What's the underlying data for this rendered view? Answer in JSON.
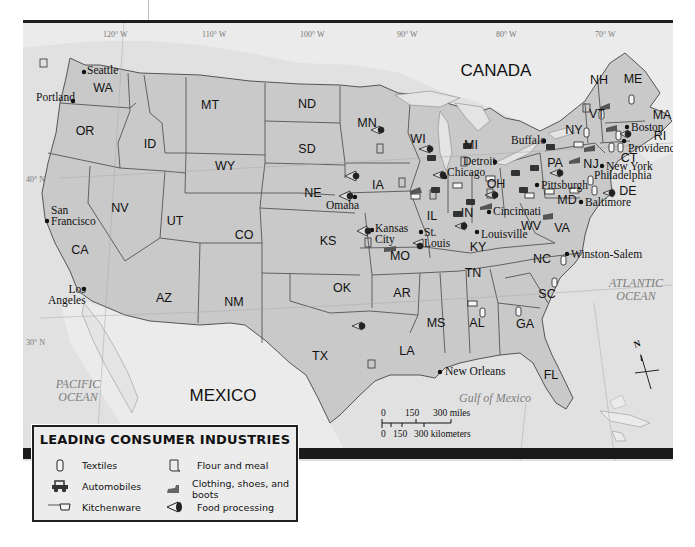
{
  "map": {
    "countries": [
      {
        "name": "CANADA",
        "x": 496,
        "y": 68
      },
      {
        "name": "MEXICO",
        "x": 223,
        "y": 393
      }
    ],
    "water_bodies": [
      {
        "name": "PACIFIC\nOCEAN",
        "line1": "PACIFIC",
        "line2": "OCEAN",
        "x": 78,
        "y": 388
      },
      {
        "name": "ATLANTIC\nOCEAN",
        "line1": "ATLANTIC",
        "line2": "OCEAN",
        "x": 636,
        "y": 287
      },
      {
        "name": "Gulf of Mexico",
        "line1": "Gulf of Mexico",
        "line2": "",
        "x": 495,
        "y": 395
      }
    ],
    "longitude_labels": [
      "120° W",
      "110° W",
      "100° W",
      "90° W",
      "80° W",
      "70° W"
    ],
    "latitude_labels": [
      "40° N",
      "30° N"
    ],
    "states": [
      {
        "abbr": "WA",
        "x": 103,
        "y": 85
      },
      {
        "abbr": "OR",
        "x": 85,
        "y": 128
      },
      {
        "abbr": "ID",
        "x": 150,
        "y": 141
      },
      {
        "abbr": "MT",
        "x": 210,
        "y": 102
      },
      {
        "abbr": "WY",
        "x": 225,
        "y": 163
      },
      {
        "abbr": "ND",
        "x": 307,
        "y": 101
      },
      {
        "abbr": "SD",
        "x": 307,
        "y": 146
      },
      {
        "abbr": "MN",
        "x": 367,
        "y": 120
      },
      {
        "abbr": "WI",
        "x": 418,
        "y": 136
      },
      {
        "abbr": "MI",
        "x": 471,
        "y": 142
      },
      {
        "abbr": "NV",
        "x": 120,
        "y": 205
      },
      {
        "abbr": "UT",
        "x": 175,
        "y": 218
      },
      {
        "abbr": "CO",
        "x": 244,
        "y": 232
      },
      {
        "abbr": "NE",
        "x": 313,
        "y": 190
      },
      {
        "abbr": "IA",
        "x": 378,
        "y": 182
      },
      {
        "abbr": "IL",
        "x": 432,
        "y": 213
      },
      {
        "abbr": "IN",
        "x": 467,
        "y": 210
      },
      {
        "abbr": "OH",
        "x": 496,
        "y": 181
      },
      {
        "abbr": "PA",
        "x": 555,
        "y": 160
      },
      {
        "abbr": "NY",
        "x": 574,
        "y": 127
      },
      {
        "abbr": "VT",
        "x": 597,
        "y": 111
      },
      {
        "abbr": "NH",
        "x": 599,
        "y": 77
      },
      {
        "abbr": "ME",
        "x": 633,
        "y": 76
      },
      {
        "abbr": "MA",
        "x": 662,
        "y": 112
      },
      {
        "abbr": "RI",
        "x": 660,
        "y": 133
      },
      {
        "abbr": "CT",
        "x": 629,
        "y": 155
      },
      {
        "abbr": "NJ",
        "x": 591,
        "y": 161
      },
      {
        "abbr": "DE",
        "x": 628,
        "y": 188
      },
      {
        "abbr": "MD",
        "x": 567,
        "y": 197
      },
      {
        "abbr": "CA",
        "x": 80,
        "y": 247
      },
      {
        "abbr": "KS",
        "x": 328,
        "y": 238
      },
      {
        "abbr": "MO",
        "x": 400,
        "y": 253
      },
      {
        "abbr": "KY",
        "x": 478,
        "y": 244
      },
      {
        "abbr": "WV",
        "x": 531,
        "y": 223
      },
      {
        "abbr": "VA",
        "x": 562,
        "y": 225
      },
      {
        "abbr": "AZ",
        "x": 164,
        "y": 295
      },
      {
        "abbr": "NM",
        "x": 234,
        "y": 299
      },
      {
        "abbr": "OK",
        "x": 342,
        "y": 285
      },
      {
        "abbr": "AR",
        "x": 402,
        "y": 290
      },
      {
        "abbr": "TN",
        "x": 473,
        "y": 270
      },
      {
        "abbr": "NC",
        "x": 542,
        "y": 256
      },
      {
        "abbr": "SC",
        "x": 547,
        "y": 291
      },
      {
        "abbr": "MS",
        "x": 436,
        "y": 320
      },
      {
        "abbr": "AL",
        "x": 477,
        "y": 320
      },
      {
        "abbr": "GA",
        "x": 525,
        "y": 321
      },
      {
        "abbr": "LA",
        "x": 407,
        "y": 348
      },
      {
        "abbr": "TX",
        "x": 320,
        "y": 353
      },
      {
        "abbr": "FL",
        "x": 551,
        "y": 372
      }
    ],
    "cities": [
      {
        "name": "Seattle",
        "x": 84,
        "y": 69,
        "dx": 3,
        "dy": -2
      },
      {
        "name": "Portland",
        "x": 73,
        "y": 98,
        "dx": -37,
        "dy": -9
      },
      {
        "name": "San\nFrancisco",
        "line1": "San",
        "line2": "Francisco",
        "x": 47,
        "y": 218
      },
      {
        "name": "Los\nAngeles",
        "line1": "Los",
        "line2": "Angeles",
        "x": 84,
        "y": 286
      },
      {
        "name": "Omaha",
        "x": 355,
        "y": 194
      },
      {
        "name": "Kansas\nCity",
        "line1": "Kansas",
        "line2": "City",
        "x": 372,
        "y": 227
      },
      {
        "name": "St.\nLouis",
        "line1": "St.",
        "line2": "Louis",
        "x": 421,
        "y": 229
      },
      {
        "name": "Chicago",
        "x": 445,
        "y": 174
      },
      {
        "name": "Detroit",
        "x": 495,
        "y": 159
      },
      {
        "name": "Buffalo",
        "x": 544,
        "y": 138
      },
      {
        "name": "Cincinnati",
        "x": 489,
        "y": 209
      },
      {
        "name": "Louisville",
        "x": 477,
        "y": 229
      },
      {
        "name": "Pittsburgh",
        "x": 537,
        "y": 182
      },
      {
        "name": "Baltimore",
        "x": 581,
        "y": 199
      },
      {
        "name": "Philadelphia",
        "x": 590,
        "y": 178
      },
      {
        "name": "New York",
        "x": 602,
        "y": 163
      },
      {
        "name": "Providence",
        "x": 624,
        "y": 138
      },
      {
        "name": "Boston",
        "x": 627,
        "y": 124
      },
      {
        "name": "Winston-Salem",
        "x": 567,
        "y": 251
      },
      {
        "name": "New Orleans",
        "x": 440,
        "y": 369
      }
    ]
  },
  "scale_bar": {
    "miles_labels": [
      "0",
      "150",
      "300 miles"
    ],
    "km_labels": [
      "0",
      "150",
      "300 kilometers"
    ]
  },
  "compass": {
    "label": "N"
  },
  "legend": {
    "title": "LEADING CONSUMER INDUSTRIES",
    "items": [
      {
        "icon": "textiles-icon",
        "label": "Textiles"
      },
      {
        "icon": "automobiles-icon",
        "label": "Automobiles"
      },
      {
        "icon": "kitchenware-icon",
        "label": "Kitchenware"
      },
      {
        "icon": "flour-meal-icon",
        "label": "Flour and meal"
      },
      {
        "icon": "clothing-shoes-boots-icon",
        "label": "Clothing, shoes, and boots"
      },
      {
        "icon": "food-processing-icon",
        "label": "Food processing"
      }
    ]
  },
  "colors": {
    "us_states": "#c9c9c9",
    "foreign_land": "#ebebeb",
    "ocean": "#e1e1e1",
    "borders": "#555555",
    "frame": "#1e1e1e"
  }
}
